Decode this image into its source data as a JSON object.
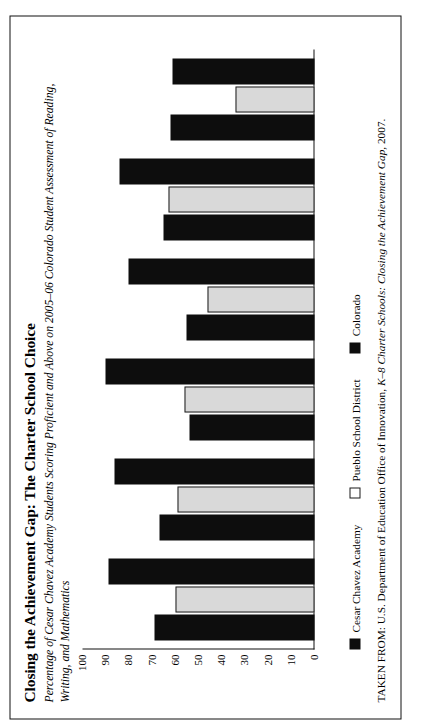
{
  "figure": {
    "title": "Closing the Achievement Gap: The Charter School Choice",
    "subtitle_line1": "Percentage of Cesar Chavez Academy Students Scoring Proficient and Above on 2005–06 Colorado  Student Assessment of Reading,",
    "subtitle_line2": "Writing, and Mathematics",
    "source_prefix": "TAKEN FROM: U.S. Department of Education Office of Innovation, ",
    "source_italic": "K–8 Charter Schools: Closing the Achievement Gap,",
    "source_suffix": " 2007."
  },
  "legend": {
    "items": [
      {
        "label": "Cesar Chavez Academy",
        "swatch": "black",
        "color": "#0d0d0d"
      },
      {
        "label": "Pueblo School District",
        "swatch": "light",
        "color": "#ffffff"
      },
      {
        "label": "Colorado",
        "swatch": "black",
        "color": "#0d0d0d"
      }
    ]
  },
  "chart_data": {
    "type": "bar",
    "title": "Closing the Achievement Gap: The Charter School Choice",
    "subtitle": "Percentage of Cesar Chavez Academy Students Scoring Proficient and Above on 2005–06 Colorado Student Assessment of Reading, Writing, and Mathematics",
    "xlabel": "",
    "ylabel": "",
    "ylim": [
      0,
      100
    ],
    "yticks": [
      0,
      10,
      20,
      30,
      40,
      50,
      60,
      70,
      80,
      90,
      100
    ],
    "grid": false,
    "legend_position": "bottom-left",
    "orientation": "vertical",
    "categories": [
      {
        "line1": "Grades 3–5",
        "line2": "Reading"
      },
      {
        "line1": "Grades 6–8",
        "line2": "Reading"
      },
      {
        "line1": "Grades 3–5",
        "line2": "Writing"
      },
      {
        "line1": "Grades 6–8",
        "line2": "Writing"
      },
      {
        "line1": "Grades 3–5",
        "line2": "Mathematics"
      },
      {
        "line1": "Grades 6–8",
        "line2": "Mathematics"
      }
    ],
    "category_labels": [
      "Grades 3–5 Reading",
      "Grades 6–8 Reading",
      "Grades 3–5 Writing",
      "Grades 6–8 Writing",
      "Grades 3–5 Mathematics",
      "Grades 6–8 Mathematics"
    ],
    "series": [
      {
        "name": "Cesar Chavez Academy",
        "color": "#0d0d0d",
        "values": [
          69,
          67,
          54,
          55,
          65,
          62
        ]
      },
      {
        "name": "Pueblo School District",
        "color": "#ffffff",
        "values": [
          60,
          59,
          56,
          46,
          63,
          34
        ]
      },
      {
        "name": "Colorado",
        "color": "#0d0d0d",
        "values": [
          89,
          86,
          90,
          80,
          84,
          61
        ]
      }
    ]
  }
}
